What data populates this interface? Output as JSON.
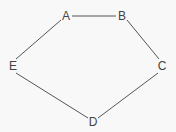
{
  "graph": {
    "type": "undirected",
    "nodes": [
      {
        "id": "A",
        "label": "A",
        "x": 66,
        "y": 16
      },
      {
        "id": "B",
        "label": "B",
        "x": 122,
        "y": 16
      },
      {
        "id": "C",
        "label": "C",
        "x": 162,
        "y": 66
      },
      {
        "id": "D",
        "label": "D",
        "x": 93,
        "y": 122
      },
      {
        "id": "E",
        "label": "E",
        "x": 13,
        "y": 66
      }
    ],
    "edges": [
      {
        "from": "A",
        "to": "B"
      },
      {
        "from": "B",
        "to": "C"
      },
      {
        "from": "C",
        "to": "D"
      },
      {
        "from": "D",
        "to": "E"
      },
      {
        "from": "E",
        "to": "A"
      }
    ]
  },
  "colors": {
    "background": "#f8f8f8",
    "edge": "#555555",
    "label": "#444444"
  }
}
